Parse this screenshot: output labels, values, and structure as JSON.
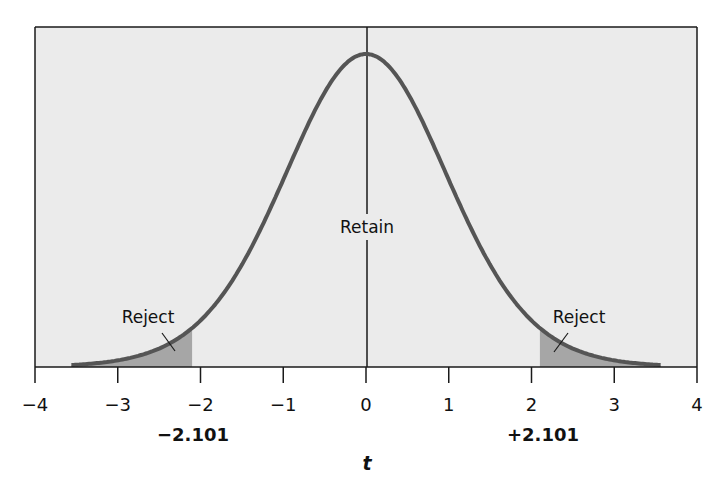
{
  "chart_data": {
    "type": "line",
    "title": "",
    "distribution": "t",
    "degrees_of_freedom": 18,
    "xlabel": "t",
    "ylabel": "",
    "xlim": [
      -4,
      4
    ],
    "x_ticks": [
      -4,
      -3,
      -2,
      -1,
      0,
      1,
      2,
      3,
      4
    ],
    "x_tick_labels": [
      "−4",
      "−3",
      "−2",
      "−1",
      "0",
      "1",
      "2",
      "3",
      "4"
    ],
    "curve_x_range": [
      -3.56,
      3.56
    ],
    "critical_values": [
      -2.101,
      2.101
    ],
    "critical_value_labels": [
      "−2.101",
      "+2.101"
    ],
    "regions": [
      {
        "name": "Reject",
        "from": -3.56,
        "to": -2.101,
        "shaded": true
      },
      {
        "name": "Retain",
        "from": -2.101,
        "to": 2.101,
        "shaded": false
      },
      {
        "name": "Reject",
        "from": 2.101,
        "to": 3.56,
        "shaded": true
      }
    ],
    "annotations": [
      "Reject",
      "Retain",
      "Reject"
    ],
    "center_line": 0,
    "grid": false,
    "legend": "none"
  },
  "labels": {
    "retain": "Retain",
    "reject_left": "Reject",
    "reject_right": "Reject",
    "crit_left": "−2.101",
    "crit_right": "+2.101",
    "x_axis_title": "t"
  },
  "colors": {
    "plot_background": "#ebebeb",
    "curve": "#555555",
    "shade": "#a6a6a6",
    "axis": "#1a1a1a"
  }
}
